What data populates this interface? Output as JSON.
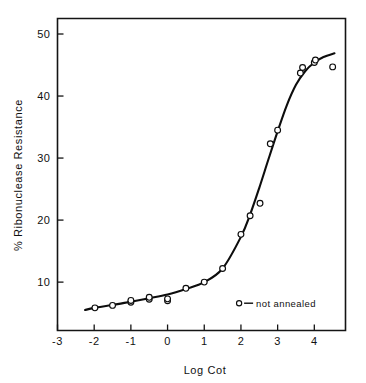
{
  "figure": {
    "background_color": "#ffffff",
    "ink_color": "#111111"
  },
  "chart_data": {
    "type": "scatter",
    "title": "",
    "subtitle": "",
    "xlabel": "Log Cot",
    "ylabel": "% Ribonuclease Resistance",
    "xlim": [
      -3,
      4.85
    ],
    "ylim": [
      2.2,
      52.5
    ],
    "xticks": [
      -3,
      -2,
      -1,
      0,
      1,
      2,
      3,
      4
    ],
    "xtick_labels": [
      "-3",
      "-2",
      "-1",
      "0",
      "1",
      "2",
      "3",
      "4"
    ],
    "yticks": [
      10,
      20,
      30,
      40,
      50
    ],
    "ytick_labels": [
      "10",
      "20",
      "30",
      "40",
      "50"
    ],
    "grid": false,
    "frame": "box",
    "legend_position": "inside-lower-right",
    "marker_style": "open-circle",
    "series": [
      {
        "name": "not annealed",
        "marker": "open-circle",
        "points": [
          {
            "x": -1.98,
            "y": 5.85
          },
          {
            "x": -1.5,
            "y": 6.25
          },
          {
            "x": -1.0,
            "y": 6.75
          },
          {
            "x": -1.0,
            "y": 7.05
          },
          {
            "x": -0.5,
            "y": 7.25
          },
          {
            "x": -0.5,
            "y": 7.55
          },
          {
            "x": 0.0,
            "y": 7.0
          },
          {
            "x": 0.0,
            "y": 7.3
          },
          {
            "x": 0.5,
            "y": 9.0
          },
          {
            "x": 1.0,
            "y": 10.0
          },
          {
            "x": 1.5,
            "y": 12.2
          },
          {
            "x": 2.0,
            "y": 17.7
          },
          {
            "x": 2.25,
            "y": 20.7
          },
          {
            "x": 2.52,
            "y": 22.7
          },
          {
            "x": 2.8,
            "y": 32.3
          },
          {
            "x": 3.0,
            "y": 34.5
          },
          {
            "x": 3.62,
            "y": 43.7
          },
          {
            "x": 3.68,
            "y": 44.6
          },
          {
            "x": 4.0,
            "y": 45.4
          },
          {
            "x": 4.03,
            "y": 45.8
          },
          {
            "x": 4.5,
            "y": 44.7
          }
        ],
        "fit_curve": [
          {
            "x": -2.25,
            "y": 5.5
          },
          {
            "x": -2.0,
            "y": 5.85
          },
          {
            "x": -1.5,
            "y": 6.3
          },
          {
            "x": -1.0,
            "y": 6.85
          },
          {
            "x": -0.5,
            "y": 7.4
          },
          {
            "x": 0.0,
            "y": 8.0
          },
          {
            "x": 0.5,
            "y": 8.9
          },
          {
            "x": 1.0,
            "y": 10.0
          },
          {
            "x": 1.5,
            "y": 12.2
          },
          {
            "x": 2.0,
            "y": 17.3
          },
          {
            "x": 2.25,
            "y": 20.9
          },
          {
            "x": 2.5,
            "y": 25.2
          },
          {
            "x": 2.75,
            "y": 29.8
          },
          {
            "x": 3.0,
            "y": 34.3
          },
          {
            "x": 3.25,
            "y": 38.5
          },
          {
            "x": 3.5,
            "y": 41.8
          },
          {
            "x": 3.75,
            "y": 44.0
          },
          {
            "x": 4.0,
            "y": 45.4
          },
          {
            "x": 4.25,
            "y": 46.3
          },
          {
            "x": 4.55,
            "y": 46.9
          }
        ]
      }
    ],
    "legend": [
      {
        "label": "not annealed",
        "marker": "open-circle",
        "separator": "—"
      }
    ],
    "annotations": []
  }
}
